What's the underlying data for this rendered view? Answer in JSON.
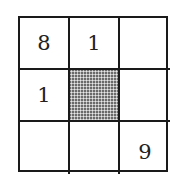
{
  "grid": {
    "rows": 3,
    "cols": 3,
    "cells": [
      [
        "8",
        "1",
        ""
      ],
      [
        "1",
        "",
        ""
      ],
      [
        "",
        "",
        "9"
      ]
    ],
    "shaded_cell": {
      "row": 1,
      "col": 1
    },
    "colors": {
      "line": "#1a1a1a",
      "shade": "#6a6a6a",
      "background": "#ffffff"
    }
  }
}
